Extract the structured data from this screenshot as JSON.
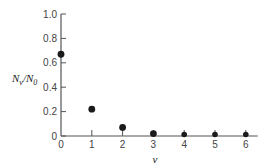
{
  "chart_data": {
    "type": "scatter",
    "title": "",
    "xlabel": "v",
    "ylabel": "N_v/N_0",
    "ylabel_main": "N",
    "ylabel_sub1": "v",
    "ylabel_mid": "/N",
    "ylabel_sub2": "0",
    "x": [
      0,
      1,
      2,
      3,
      4,
      5,
      6
    ],
    "values": [
      0.67,
      0.22,
      0.07,
      0.02,
      0.01,
      0.003,
      0.001
    ],
    "xticks": [
      "0",
      "1",
      "2",
      "3",
      "4",
      "5",
      "6"
    ],
    "yticks": [
      "0",
      "0.2",
      "0.4",
      "0.6",
      "0.8",
      "1.0"
    ],
    "xlim": [
      0,
      6
    ],
    "ylim": [
      0,
      1.0
    ],
    "grid": false,
    "legend": null
  }
}
